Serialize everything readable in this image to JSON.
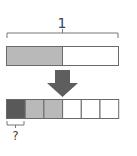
{
  "diagram": {
    "top_label": "1",
    "bottom_label": "?",
    "top_bar": {
      "parts": 2,
      "shaded": 1,
      "shade_color": "#b9b9b9"
    },
    "bottom_bar": {
      "parts": 6,
      "cells": [
        "dark",
        "light",
        "light",
        "empty",
        "empty",
        "empty"
      ],
      "dark_color": "#595959",
      "light_color": "#b9b9b9"
    },
    "arrow_color": "#5e5e5e",
    "stroke_color": "#6a6a6a"
  }
}
